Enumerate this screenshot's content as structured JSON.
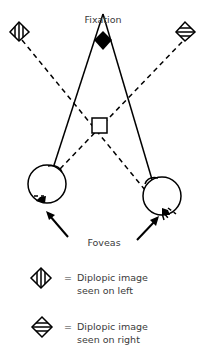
{
  "labels": {
    "fixation": "Fixation",
    "foveas": "Foveas"
  },
  "legend": [
    {
      "icon": "vertical-stripe-diamond-icon",
      "equals": "=",
      "line1": "Diplopic image",
      "line2": "seen on left"
    },
    {
      "icon": "horizontal-stripe-diamond-icon",
      "equals": "=",
      "line1": "Diplopic image",
      "line2": "seen on right"
    }
  ],
  "colors": {
    "stroke": "#000000",
    "text": "#3a3a3a",
    "background": "#ffffff"
  }
}
